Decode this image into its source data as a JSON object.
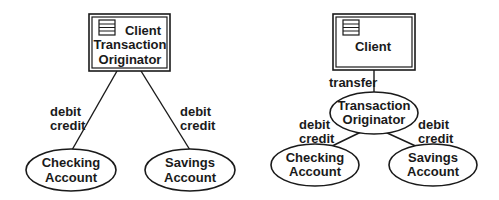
{
  "diagrams": [
    {
      "name": "left-diagram",
      "box": {
        "lines": [
          "Client",
          "Transaction",
          "Originator"
        ]
      },
      "edges": [
        {
          "label_lines": [
            "debit",
            "credit"
          ]
        },
        {
          "label_lines": [
            "debit",
            "credit"
          ]
        }
      ],
      "nodes": [
        {
          "lines": [
            "Checking",
            "Account"
          ]
        },
        {
          "lines": [
            "Savings",
            "Account"
          ]
        }
      ]
    },
    {
      "name": "right-diagram",
      "box": {
        "lines": [
          "Client"
        ]
      },
      "transfer_label": "transfer",
      "middle": {
        "lines": [
          "Transaction",
          "Originator"
        ]
      },
      "edges": [
        {
          "label_lines": [
            "debit",
            "credit"
          ]
        },
        {
          "label_lines": [
            "debit",
            "credit"
          ]
        }
      ],
      "nodes": [
        {
          "lines": [
            "Checking",
            "Account"
          ]
        },
        {
          "lines": [
            "Savings",
            "Account"
          ]
        }
      ]
    }
  ],
  "icons": {
    "box_icon": "striped-list-icon"
  },
  "colors": {
    "stroke": "#1a1a1a",
    "background": "#ffffff"
  }
}
